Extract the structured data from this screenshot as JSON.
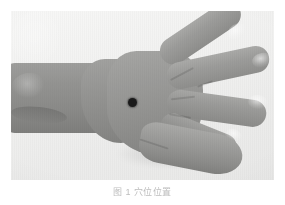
{
  "figure": {
    "kind": "photograph",
    "color_mode": "grayscale",
    "caption": "图 1  穴位位置",
    "plate": {
      "background_color": "#f1f1f0",
      "skin_color": "#939391",
      "shadow_color": "#0000001f"
    },
    "marker": {
      "label": "acupoint marker dot",
      "color": "#1a1a1a",
      "x": 121,
      "y": 91,
      "diameter": 9
    },
    "fingers": [
      {
        "name": "index-finger",
        "nail": "index-fingernail"
      },
      {
        "name": "middle-finger",
        "nail": "middle-fingernail"
      },
      {
        "name": "ring-finger",
        "nail": "ring-fingernail"
      },
      {
        "name": "little-finger",
        "nail": "little-fingernail"
      }
    ],
    "parts": [
      {
        "name": "forearm"
      },
      {
        "name": "wrist"
      },
      {
        "name": "palm-dorsum"
      },
      {
        "name": "thumb"
      }
    ]
  }
}
